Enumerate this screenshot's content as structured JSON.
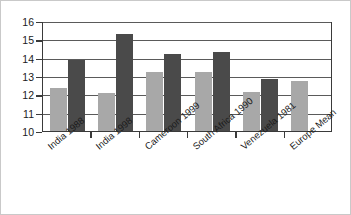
{
  "chart_data": {
    "type": "bar",
    "title": "",
    "subtitle": "",
    "xlabel": "",
    "ylabel": "",
    "ylim": [
      10,
      16
    ],
    "yticks": [
      10,
      11,
      12,
      13,
      14,
      15,
      16
    ],
    "ytick_labels": [
      "10",
      "11",
      "12",
      "13",
      "14",
      "15",
      "16"
    ],
    "grid": true,
    "grid_axis": "y",
    "legend": false,
    "legend_position": "none",
    "categories": [
      "India 1988",
      "India 1998",
      "Cameroon 1999",
      "South Africa 1990",
      "Venezuela 1981",
      "Europe Mean"
    ],
    "series": [
      {
        "name": "series-1",
        "color": "#a8a8a8",
        "values": [
          12.35,
          12.1,
          13.2,
          13.2,
          12.15,
          12.75
        ]
      },
      {
        "name": "series-2",
        "color": "#4a4a4a",
        "values": [
          13.85,
          15.3,
          14.2,
          14.3,
          12.85,
          null
        ]
      }
    ]
  },
  "style": {
    "background": "#ffffff",
    "axis_color": "#3a3a3a",
    "grid_color": "#5a5a5a",
    "border_color": "#c9c9c9",
    "text_color": "#1a1a1a"
  }
}
